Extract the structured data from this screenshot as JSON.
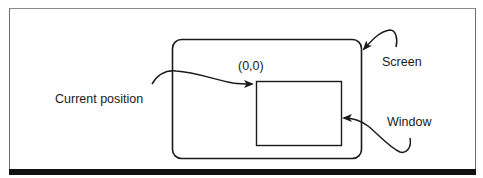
{
  "diagram": {
    "labels": {
      "origin": "(0,0)",
      "screen": "Screen",
      "current_position": "Current position",
      "window": "Window"
    },
    "shapes": {
      "screen": {
        "name": "Screen",
        "x": 172,
        "y": 39,
        "width": 189,
        "height": 119,
        "corner_radius": 9
      },
      "window": {
        "name": "Window",
        "x": 256,
        "y": 81,
        "width": 85,
        "height": 64
      }
    },
    "arrows": [
      {
        "from": "Current position",
        "to": "(0,0) / window top-left"
      },
      {
        "from": "Screen",
        "to": "screen top-right corner"
      },
      {
        "from": "Window",
        "to": "window right edge"
      }
    ],
    "colors": {
      "stroke": "#1a1a1a",
      "background": "#ffffff",
      "frame": "#6f6f6f",
      "bottom_bar": "#111111"
    }
  }
}
